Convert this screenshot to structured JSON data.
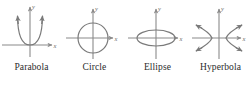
{
  "figure": {
    "background_color": "#ffffff",
    "axis_color": "#8a8a8a",
    "curve_color": "#7a7a7a",
    "caption_color": "#2b2b2b",
    "panels": [
      {
        "name": "parabola",
        "caption": "Parabola",
        "x_axis_label": "x",
        "y_axis_label": "y",
        "curve_type": "parabola",
        "arrow_ends": 2,
        "description": "Upward opening parabola with vertex at origin"
      },
      {
        "name": "circle",
        "caption": "Circle",
        "x_axis_label": "x",
        "y_axis_label": "y",
        "curve_type": "circle",
        "arrow_ends": 0,
        "description": "Circle centered at the origin"
      },
      {
        "name": "ellipse",
        "caption": "Ellipse",
        "x_axis_label": "x",
        "y_axis_label": "y",
        "curve_type": "ellipse",
        "arrow_ends": 0,
        "description": "Horizontally elongated ellipse centered at the origin"
      },
      {
        "name": "hyperbola",
        "caption": "Hyperbola",
        "x_axis_label": "x",
        "y_axis_label": "y",
        "curve_type": "hyperbola",
        "arrow_ends": 4,
        "description": "Left and right opening hyperbola branches"
      }
    ]
  }
}
